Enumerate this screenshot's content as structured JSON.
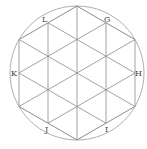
{
  "diagram": {
    "colors": {
      "line": "#8a8a8a",
      "circle": "#9a9a9a",
      "label": "#444444",
      "background": "#ffffff"
    },
    "labels": [
      {
        "id": "L",
        "text": "L",
        "x": 42,
        "y": 22
      },
      {
        "id": "G",
        "text": "G",
        "x": 104,
        "y": 22
      },
      {
        "id": "K",
        "text": "K",
        "x": 11,
        "y": 76
      },
      {
        "id": "H",
        "text": "H",
        "x": 135,
        "y": 76
      },
      {
        "id": "J",
        "text": "J",
        "x": 45,
        "y": 132
      },
      {
        "id": "I",
        "text": "I",
        "x": 105,
        "y": 132
      }
    ]
  }
}
